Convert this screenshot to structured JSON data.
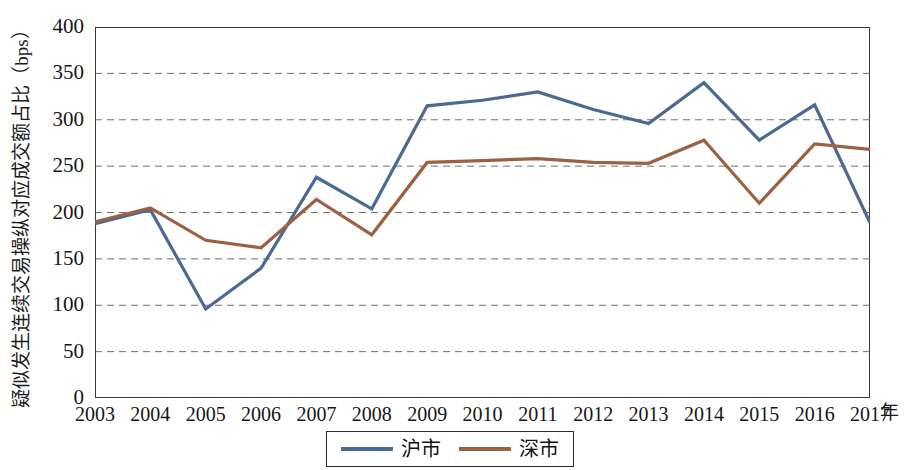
{
  "chart_data": {
    "type": "line",
    "title": "",
    "xlabel": "年",
    "ylabel": "疑似发生连续交易操纵对应成交额占比（bps）",
    "x": [
      "2003",
      "2004",
      "2005",
      "2006",
      "2007",
      "2008",
      "2009",
      "2010",
      "2011",
      "2012",
      "2013",
      "2014",
      "2015",
      "2016",
      "2017"
    ],
    "categories": [
      "2003",
      "2004",
      "2005",
      "2006",
      "2007",
      "2008",
      "2009",
      "2010",
      "2011",
      "2012",
      "2013",
      "2014",
      "2015",
      "2016",
      "2017"
    ],
    "ylim": [
      0,
      400
    ],
    "yticks": [
      "0",
      "50",
      "100",
      "150",
      "200",
      "250",
      "300",
      "350",
      "400"
    ],
    "ytick_values": [
      0,
      50,
      100,
      150,
      200,
      250,
      300,
      350,
      400
    ],
    "grid": true,
    "grid_style": "dashed-horizontal",
    "legend_position": "bottom-center",
    "series": [
      {
        "name": "沪市",
        "color": "#4a6a93",
        "values": [
          188,
          203,
          96,
          140,
          238,
          204,
          315,
          321,
          330,
          311,
          296,
          340,
          278,
          316,
          189
        ]
      },
      {
        "name": "深市",
        "color": "#9c6142",
        "values": [
          190,
          205,
          170,
          162,
          214,
          176,
          254,
          256,
          258,
          254,
          253,
          278,
          210,
          274,
          268
        ]
      }
    ]
  },
  "axes": {
    "y_title": "疑似发生连续交易操纵对应成交额占比（bps）",
    "x_unit": "年"
  },
  "legend": {
    "items": [
      {
        "label": "沪市",
        "color": "#4a6a93"
      },
      {
        "label": "深市",
        "color": "#9c6142"
      }
    ]
  }
}
